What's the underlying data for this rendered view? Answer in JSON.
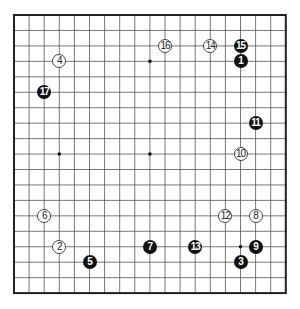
{
  "board": {
    "size": 19,
    "origin_x": 14,
    "origin_y": 15,
    "spacing_x": 15.1,
    "spacing_y": 15.45,
    "line_color": "#555555",
    "border_color": "#222222",
    "star_points": [
      [
        3,
        3
      ],
      [
        9,
        3
      ],
      [
        15,
        3
      ],
      [
        3,
        9
      ],
      [
        9,
        9
      ],
      [
        15,
        9
      ],
      [
        3,
        15
      ],
      [
        9,
        15
      ],
      [
        15,
        15
      ]
    ]
  },
  "stones": [
    {
      "move": "1",
      "color": "black",
      "col": 15,
      "row": 3
    },
    {
      "move": "2",
      "color": "white",
      "col": 3,
      "row": 15
    },
    {
      "move": "3",
      "color": "black",
      "col": 15,
      "row": 16
    },
    {
      "move": "4",
      "color": "white",
      "col": 3,
      "row": 3
    },
    {
      "move": "5",
      "color": "black",
      "col": 5,
      "row": 16
    },
    {
      "move": "6",
      "color": "white",
      "col": 2,
      "row": 13
    },
    {
      "move": "7",
      "color": "black",
      "col": 9,
      "row": 15
    },
    {
      "move": "8",
      "color": "white",
      "col": 16,
      "row": 13
    },
    {
      "move": "9",
      "color": "black",
      "col": 16,
      "row": 15
    },
    {
      "move": "10",
      "color": "white",
      "col": 15,
      "row": 9
    },
    {
      "move": "11",
      "color": "black",
      "col": 16,
      "row": 7
    },
    {
      "move": "12",
      "color": "white",
      "col": 14,
      "row": 13
    },
    {
      "move": "13",
      "color": "black",
      "col": 12,
      "row": 15
    },
    {
      "move": "14",
      "color": "white",
      "col": 13,
      "row": 2
    },
    {
      "move": "15",
      "color": "black",
      "col": 15,
      "row": 2
    },
    {
      "move": "16",
      "color": "white",
      "col": 10,
      "row": 2
    },
    {
      "move": "17",
      "color": "black",
      "col": 2,
      "row": 5
    }
  ]
}
